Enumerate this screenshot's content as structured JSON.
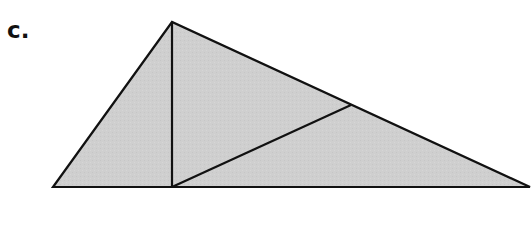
{
  "figure": {
    "label": "c.",
    "next_label_fragment": "-",
    "colors": {
      "fill": "#cfcfcf",
      "stroke": "#111111",
      "background": "#ffffff"
    },
    "stroke_width": 2.2,
    "points": {
      "left_vertex": [
        53,
        187
      ],
      "apex": [
        172,
        22
      ],
      "right_vertex": [
        530,
        187
      ],
      "foot_of_altitude": [
        172,
        187
      ],
      "interior_point": [
        351,
        105
      ]
    },
    "outer_triangle": [
      [
        53,
        187
      ],
      [
        172,
        22
      ],
      [
        530,
        187
      ]
    ],
    "segments": [
      {
        "name": "altitude",
        "from": [
          172,
          22
        ],
        "to": [
          172,
          187
        ]
      },
      {
        "name": "diagonal",
        "from": [
          172,
          187
        ],
        "to": [
          351,
          105
        ]
      }
    ]
  }
}
